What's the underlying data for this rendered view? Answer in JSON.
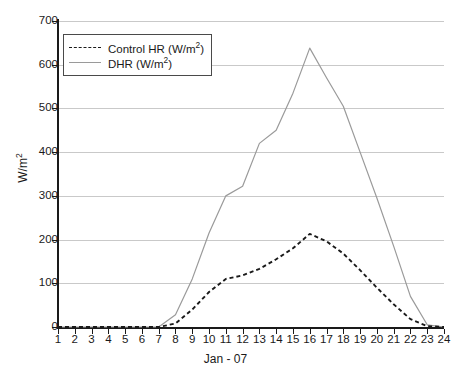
{
  "chart_data": {
    "type": "line",
    "title": "",
    "xlabel": "Jan - 07",
    "ylabel": "W/m2",
    "ylabel_html": "W/m<sup>2</sup>",
    "xlim": [
      1,
      24
    ],
    "ylim": [
      0,
      700
    ],
    "yticks": [
      0,
      100,
      200,
      300,
      400,
      500,
      600,
      700
    ],
    "xticks": [
      1,
      2,
      3,
      4,
      5,
      6,
      7,
      8,
      9,
      10,
      11,
      12,
      13,
      14,
      15,
      16,
      17,
      18,
      19,
      20,
      21,
      22,
      23,
      24
    ],
    "grid": "horizontal",
    "legend_position": "upper-left",
    "x": [
      1,
      2,
      3,
      4,
      5,
      6,
      7,
      8,
      9,
      10,
      11,
      12,
      13,
      14,
      15,
      16,
      17,
      18,
      19,
      20,
      21,
      22,
      23,
      24
    ],
    "series": [
      {
        "name": "Control HR (W/m2)",
        "label_html": "Control HR (W/m<sup>2</sup>)",
        "style": "dashed",
        "color": "#1a1a1a",
        "values": [
          0,
          0,
          0,
          0,
          0,
          0,
          0,
          8,
          40,
          80,
          110,
          118,
          133,
          155,
          180,
          213,
          196,
          168,
          130,
          90,
          52,
          18,
          2,
          0
        ]
      },
      {
        "name": "DHR (W/m2)",
        "label_html": "DHR (W/m<sup>2</sup>)",
        "style": "solid",
        "color": "#9a9a9a",
        "values": [
          0,
          0,
          0,
          0,
          0,
          0,
          0,
          28,
          110,
          215,
          300,
          322,
          420,
          450,
          535,
          638,
          570,
          505,
          400,
          295,
          185,
          70,
          5,
          0
        ]
      }
    ]
  },
  "axes": {
    "ylabel_text": "W/m2",
    "xlabel_text": "Jan - 07"
  },
  "legend": {
    "items": [
      {
        "label": "Control HR (W/m2)"
      },
      {
        "label": "DHR (W/m2)"
      }
    ]
  },
  "colors": {
    "control_hr": "#1a1a1a",
    "dhr": "#9a9a9a",
    "gridline": "#c9c9c9",
    "axis": "#1a1a1a",
    "background": "#ffffff"
  }
}
